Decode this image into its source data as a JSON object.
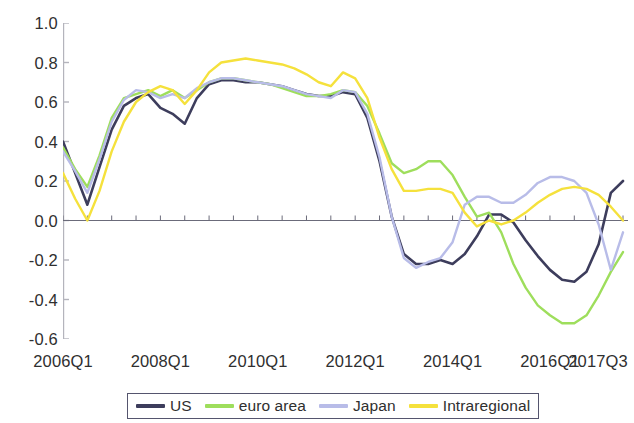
{
  "chart_data": {
    "type": "line",
    "title": "",
    "subtitle": "",
    "xlabel": "",
    "ylabel": "",
    "ylim": [
      -0.6,
      1.0
    ],
    "ytick_labels": [
      "1.0",
      "0.8",
      "0.6",
      "0.4",
      "0.2",
      "0.0",
      "-0.2",
      "-0.4",
      "-0.6"
    ],
    "ytick_values": [
      1.0,
      0.8,
      0.6,
      0.4,
      0.2,
      0.0,
      -0.2,
      -0.4,
      -0.6
    ],
    "xtick_labels": [
      "2006Q1",
      "2008Q1",
      "2010Q1",
      "2012Q1",
      "2014Q1",
      "2016Q1",
      "2017Q3"
    ],
    "xtick_values": [
      0,
      8,
      16,
      24,
      32,
      40,
      46
    ],
    "grid": false,
    "zero_line": true,
    "legend_position": "bottom",
    "x": [
      "2006Q1",
      "2006Q2",
      "2006Q3",
      "2006Q4",
      "2007Q1",
      "2007Q2",
      "2007Q3",
      "2007Q4",
      "2008Q1",
      "2008Q2",
      "2008Q3",
      "2008Q4",
      "2009Q1",
      "2009Q2",
      "2009Q3",
      "2009Q4",
      "2010Q1",
      "2010Q2",
      "2010Q3",
      "2010Q4",
      "2011Q1",
      "2011Q2",
      "2011Q3",
      "2011Q4",
      "2012Q1",
      "2012Q2",
      "2012Q3",
      "2012Q4",
      "2013Q1",
      "2013Q2",
      "2013Q3",
      "2013Q4",
      "2014Q1",
      "2014Q2",
      "2014Q3",
      "2014Q4",
      "2015Q1",
      "2015Q2",
      "2015Q3",
      "2015Q4",
      "2016Q1",
      "2016Q2",
      "2016Q3",
      "2016Q4",
      "2017Q1",
      "2017Q2",
      "2017Q3"
    ],
    "series": [
      {
        "name": "US",
        "color": "#3d3d5c",
        "values": [
          0.4,
          0.24,
          0.08,
          0.27,
          0.46,
          0.58,
          0.62,
          0.64,
          0.57,
          0.54,
          0.49,
          0.62,
          0.69,
          0.71,
          0.71,
          0.7,
          0.7,
          0.69,
          0.68,
          0.66,
          0.64,
          0.63,
          0.63,
          0.65,
          0.64,
          0.52,
          0.3,
          0.02,
          -0.17,
          -0.22,
          -0.22,
          -0.2,
          -0.22,
          -0.17,
          -0.08,
          0.03,
          0.03,
          -0.01,
          -0.1,
          -0.18,
          -0.25,
          -0.3,
          -0.31,
          -0.26,
          -0.12,
          0.14,
          0.2
        ]
      },
      {
        "name": "euro area",
        "color": "#9ede5c",
        "values": [
          0.37,
          0.26,
          0.17,
          0.33,
          0.52,
          0.62,
          0.64,
          0.66,
          0.63,
          0.66,
          0.62,
          0.66,
          0.7,
          0.72,
          0.72,
          0.71,
          0.7,
          0.69,
          0.67,
          0.65,
          0.63,
          0.63,
          0.64,
          0.66,
          0.65,
          0.58,
          0.44,
          0.29,
          0.24,
          0.26,
          0.3,
          0.3,
          0.23,
          0.12,
          0.02,
          0.04,
          -0.06,
          -0.22,
          -0.34,
          -0.43,
          -0.48,
          -0.52,
          -0.52,
          -0.48,
          -0.38,
          -0.26,
          -0.16
        ]
      },
      {
        "name": "Japan",
        "color": "#b8bce8",
        "values": [
          0.35,
          0.25,
          0.14,
          0.31,
          0.5,
          0.61,
          0.66,
          0.65,
          0.62,
          0.64,
          0.62,
          0.67,
          0.7,
          0.72,
          0.72,
          0.71,
          0.7,
          0.69,
          0.68,
          0.66,
          0.64,
          0.63,
          0.62,
          0.66,
          0.65,
          0.54,
          0.32,
          0.02,
          -0.19,
          -0.24,
          -0.21,
          -0.19,
          -0.11,
          0.08,
          0.12,
          0.12,
          0.09,
          0.09,
          0.13,
          0.19,
          0.22,
          0.22,
          0.2,
          0.14,
          -0.02,
          -0.25,
          -0.06
        ]
      },
      {
        "name": "Intraregional",
        "color": "#f5e13c",
        "values": [
          0.24,
          0.11,
          0.0,
          0.15,
          0.35,
          0.5,
          0.6,
          0.65,
          0.68,
          0.66,
          0.59,
          0.66,
          0.75,
          0.8,
          0.81,
          0.82,
          0.81,
          0.8,
          0.79,
          0.77,
          0.74,
          0.7,
          0.68,
          0.75,
          0.72,
          0.62,
          0.42,
          0.26,
          0.15,
          0.15,
          0.16,
          0.16,
          0.14,
          0.04,
          -0.03,
          0.0,
          -0.02,
          0.0,
          0.04,
          0.09,
          0.13,
          0.16,
          0.17,
          0.16,
          0.13,
          0.07,
          0.0
        ]
      }
    ]
  },
  "legend": {
    "items": [
      {
        "label": "US",
        "color": "#3d3d5c"
      },
      {
        "label": "euro area",
        "color": "#9ede5c"
      },
      {
        "label": "Japan",
        "color": "#b8bce8"
      },
      {
        "label": "Intraregional",
        "color": "#f5e13c"
      }
    ]
  },
  "axis": {
    "zero_line_color": "#6b6b7a",
    "axis_color": "#b4b4bc"
  }
}
